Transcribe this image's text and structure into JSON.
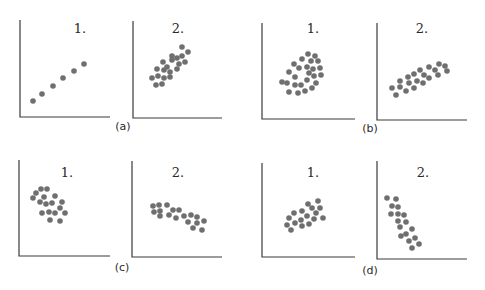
{
  "figure": {
    "labels": [
      "(a)",
      "(b)",
      "(c)",
      "(d)"
    ],
    "panel_titles": [
      "1.",
      "2."
    ]
  },
  "chart_data": {
    "type": "scatter",
    "title": "",
    "xlabel": "",
    "ylabel": "",
    "grid": false,
    "legend": null,
    "note": "Coordinates are pixel positions in the 485x290 image; axes have no ticks or numeric labels.",
    "panels": [
      {
        "group": "(a)",
        "title": "1.",
        "axes": {
          "x0": 20,
          "x1": 110,
          "y0": 20,
          "y1": 117
        },
        "title_pos": [
          80,
          33
        ],
        "points": [
          [
            33,
            101
          ],
          [
            42,
            94
          ],
          [
            53,
            86
          ],
          [
            63,
            78
          ],
          [
            74,
            71
          ],
          [
            84,
            64
          ]
        ]
      },
      {
        "group": "(a)",
        "title": "2.",
        "axes": {
          "x0": 133,
          "x1": 222,
          "y0": 21,
          "y1": 118
        },
        "title_pos": [
          178,
          33
        ],
        "points": [
          [
            152,
            78
          ],
          [
            156,
            85
          ],
          [
            157,
            69
          ],
          [
            158,
            76
          ],
          [
            162,
            84
          ],
          [
            163,
            62
          ],
          [
            164,
            70
          ],
          [
            164,
            78
          ],
          [
            167,
            67
          ],
          [
            170,
            72
          ],
          [
            170,
            77
          ],
          [
            172,
            56
          ],
          [
            172,
            60
          ],
          [
            177,
            58
          ],
          [
            177,
            69
          ],
          [
            179,
            64
          ],
          [
            182,
            47
          ],
          [
            182,
            56
          ],
          [
            185,
            62
          ],
          [
            188,
            52
          ]
        ]
      },
      {
        "group": "(b)",
        "title": "1.",
        "axes": {
          "x0": 262,
          "x1": 355,
          "y0": 23,
          "y1": 119
        },
        "title_pos": [
          313,
          33
        ],
        "points": [
          [
            282,
            82
          ],
          [
            287,
            83
          ],
          [
            289,
            92
          ],
          [
            289,
            72
          ],
          [
            294,
            64
          ],
          [
            295,
            77
          ],
          [
            295,
            85
          ],
          [
            298,
            93
          ],
          [
            299,
            68
          ],
          [
            301,
            85
          ],
          [
            302,
            59
          ],
          [
            305,
            91
          ],
          [
            307,
            67
          ],
          [
            307,
            80
          ],
          [
            308,
            54
          ],
          [
            309,
            73
          ],
          [
            311,
            61
          ],
          [
            312,
            88
          ],
          [
            313,
            69
          ],
          [
            314,
            76
          ],
          [
            315,
            56
          ],
          [
            316,
            83
          ],
          [
            318,
            61
          ],
          [
            320,
            68
          ],
          [
            321,
            75
          ]
        ]
      },
      {
        "group": "(b)",
        "title": "2.",
        "axes": {
          "x0": 377,
          "x1": 467,
          "y0": 23,
          "y1": 120
        },
        "title_pos": [
          422,
          33
        ],
        "points": [
          [
            392,
            88
          ],
          [
            396,
            95
          ],
          [
            400,
            87
          ],
          [
            400,
            81
          ],
          [
            406,
            91
          ],
          [
            408,
            77
          ],
          [
            409,
            83
          ],
          [
            414,
            74
          ],
          [
            414,
            88
          ],
          [
            417,
            81
          ],
          [
            420,
            70
          ],
          [
            423,
            83
          ],
          [
            424,
            75
          ],
          [
            429,
            67
          ],
          [
            429,
            78
          ],
          [
            435,
            70
          ],
          [
            438,
            75
          ],
          [
            439,
            64
          ],
          [
            445,
            66
          ],
          [
            447,
            71
          ]
        ]
      },
      {
        "group": "(c)",
        "title": "1.",
        "axes": {
          "x0": 19,
          "x1": 110,
          "y0": 160,
          "y1": 256
        },
        "title_pos": [
          67,
          177
        ],
        "points": [
          [
            33,
            198
          ],
          [
            36,
            193
          ],
          [
            41,
            189
          ],
          [
            47,
            189
          ],
          [
            40,
            202
          ],
          [
            44,
            197
          ],
          [
            46,
            204
          ],
          [
            52,
            203
          ],
          [
            55,
            196
          ],
          [
            42,
            213
          ],
          [
            49,
            212
          ],
          [
            55,
            213
          ],
          [
            60,
            208
          ],
          [
            62,
            202
          ],
          [
            65,
            213
          ],
          [
            50,
            220
          ],
          [
            60,
            221
          ]
        ]
      },
      {
        "group": "(c)",
        "title": "2.",
        "axes": {
          "x0": 132,
          "x1": 222,
          "y0": 161,
          "y1": 257
        },
        "title_pos": [
          178,
          177
        ],
        "points": [
          [
            153,
            206
          ],
          [
            154,
            212
          ],
          [
            159,
            205
          ],
          [
            160,
            211
          ],
          [
            160,
            216
          ],
          [
            167,
            205
          ],
          [
            169,
            215
          ],
          [
            173,
            210
          ],
          [
            176,
            218
          ],
          [
            179,
            210
          ],
          [
            184,
            216
          ],
          [
            191,
            215
          ],
          [
            188,
            222
          ],
          [
            197,
            217
          ],
          [
            197,
            223
          ],
          [
            193,
            228
          ],
          [
            204,
            221
          ],
          [
            202,
            230
          ]
        ]
      },
      {
        "group": "(d)",
        "title": "1.",
        "axes": {
          "x0": 262,
          "x1": 355,
          "y0": 163,
          "y1": 257
        },
        "title_pos": [
          313,
          177
        ],
        "points": [
          [
            287,
            225
          ],
          [
            289,
            218
          ],
          [
            291,
            230
          ],
          [
            294,
            213
          ],
          [
            295,
            223
          ],
          [
            301,
            220
          ],
          [
            302,
            211
          ],
          [
            302,
            226
          ],
          [
            308,
            204
          ],
          [
            307,
            216
          ],
          [
            309,
            224
          ],
          [
            312,
            208
          ],
          [
            314,
            219
          ],
          [
            316,
            213
          ],
          [
            318,
            201
          ],
          [
            320,
            208
          ],
          [
            323,
            218
          ]
        ]
      },
      {
        "group": "(d)",
        "title": "2.",
        "axes": {
          "x0": 377,
          "x1": 467,
          "y0": 161,
          "y1": 259
        },
        "title_pos": [
          423,
          177
        ],
        "points": [
          [
            387,
            198
          ],
          [
            396,
            199
          ],
          [
            392,
            206
          ],
          [
            398,
            207
          ],
          [
            391,
            214
          ],
          [
            398,
            214
          ],
          [
            404,
            215
          ],
          [
            398,
            221
          ],
          [
            406,
            222
          ],
          [
            400,
            227
          ],
          [
            412,
            229
          ],
          [
            401,
            236
          ],
          [
            406,
            234
          ],
          [
            415,
            238
          ],
          [
            409,
            241
          ],
          [
            419,
            244
          ],
          [
            412,
            248
          ]
        ]
      }
    ],
    "group_labels": [
      {
        "text": "(a)",
        "pos": [
          123,
          130
        ]
      },
      {
        "text": "(b)",
        "pos": [
          370,
          132
        ]
      },
      {
        "text": "(c)",
        "pos": [
          122,
          271
        ]
      },
      {
        "text": "(d)",
        "pos": [
          370,
          274
        ]
      }
    ]
  }
}
